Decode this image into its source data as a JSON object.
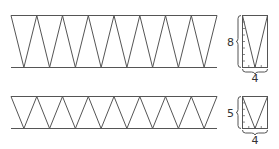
{
  "diagram": {
    "top_band": {
      "triangles_down": 8,
      "height_label": "8",
      "width_label": "4"
    },
    "bottom_band": {
      "triangles_down": 8,
      "height_label": "5",
      "width_label": "4"
    }
  },
  "colors": {
    "stroke": "#555555"
  }
}
